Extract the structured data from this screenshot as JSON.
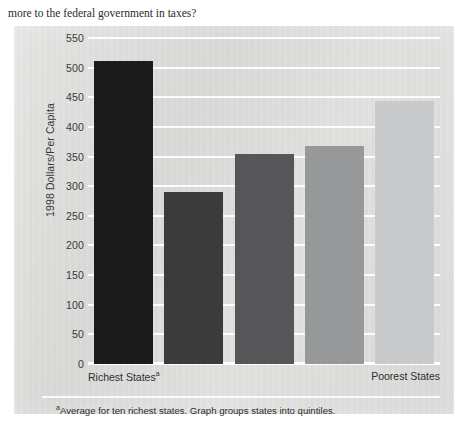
{
  "body_text": "more to the federal government in taxes?",
  "chart_data": {
    "type": "bar",
    "title": "",
    "subtitle": "",
    "xlabel": "",
    "ylabel": "1998 Dollars/Per Capita",
    "ylim": [
      0,
      550
    ],
    "grid": true,
    "legend": null,
    "categories": [
      "Richest States",
      "2nd quintile",
      "3rd quintile",
      "4th quintile",
      "Poorest States"
    ],
    "values": [
      512,
      290,
      355,
      368,
      443
    ],
    "bar_colors": [
      "#1c1b1b",
      "#3b3b3c",
      "#565658",
      "#97989a",
      "#c9cacb"
    ],
    "ytick_labels": [
      "550",
      "500",
      "450",
      "400",
      "350",
      "300",
      "250",
      "200",
      "150",
      "100",
      "50",
      "0"
    ],
    "ytick_values": [
      550,
      500,
      450,
      400,
      350,
      300,
      250,
      200,
      150,
      100,
      50,
      0
    ],
    "axis_labels": {
      "left": "Richest States",
      "left_footnote_marker": "a",
      "right": "Poorest States"
    },
    "annotations": [
      {
        "marker": "a",
        "text": "Average for ten richest states. Graph groups states into quintiles."
      }
    ]
  }
}
